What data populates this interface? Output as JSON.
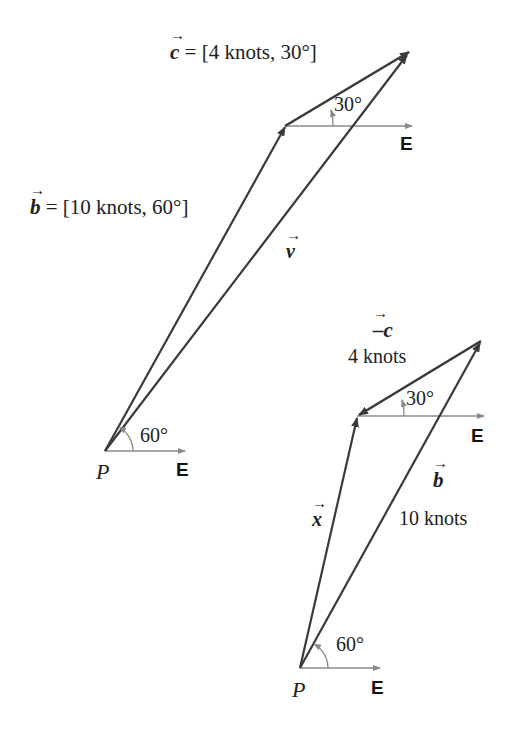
{
  "diagram": {
    "top": {
      "c_label": "= [4 knots, 30°]",
      "c_symbol": "c",
      "b_label": "= [10 knots, 60°]",
      "b_symbol": "b",
      "v_symbol": "v",
      "angle_top": "30°",
      "angle_bottom": "60°",
      "east_top": "E",
      "east_bottom": "E",
      "origin": "P"
    },
    "bottom": {
      "neg_c_symbol": "–c",
      "neg_c_magnitude": "4 knots",
      "b_symbol": "b",
      "b_magnitude": "10 knots",
      "x_symbol": "x",
      "angle_top": "30°",
      "angle_bottom": "60°",
      "east_top": "E",
      "east_bottom": "E",
      "origin": "P"
    },
    "colors": {
      "vector": "#3a3a3a",
      "axis": "#8a8a8a"
    }
  }
}
